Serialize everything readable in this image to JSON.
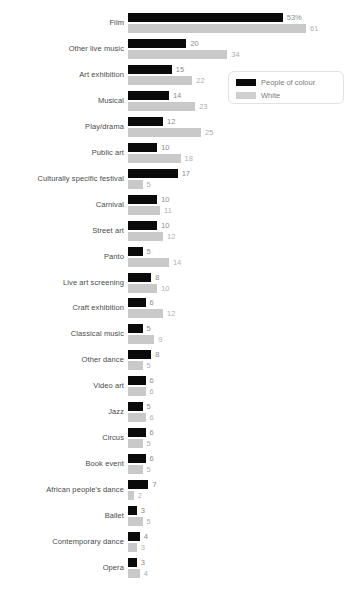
{
  "chart_data": {
    "type": "bar",
    "orientation": "horizontal",
    "title": "",
    "subtitle": "",
    "xlabel": "",
    "ylabel": "",
    "grid": false,
    "legend_position": "top-right",
    "xlim": [
      0,
      61
    ],
    "categories": [
      "Film",
      "Other live music",
      "Art exhibition",
      "Musical",
      "Play/drama",
      "Public art",
      "Culturally specific festival",
      "Carnival",
      "Street art",
      "Panto",
      "Live art screening",
      "Craft exhibition",
      "Classical music",
      "Other dance",
      "Video art",
      "Jazz",
      "Circus",
      "Book event",
      "African people's dance",
      "Ballet",
      "Contemporary dance",
      "Opera"
    ],
    "series": [
      {
        "name": "People of colour",
        "color": "#0a0a0a",
        "values": [
          53,
          20,
          15,
          14,
          12,
          10,
          17,
          10,
          10,
          5,
          8,
          6,
          5,
          8,
          6,
          5,
          6,
          6,
          7,
          3,
          4,
          3
        ],
        "labels": [
          "53%",
          "20",
          "15",
          "14",
          "12",
          "10",
          "17",
          "10",
          "10",
          "5",
          "8",
          "6",
          "5",
          "8",
          "6",
          "5",
          "6",
          "6",
          "7",
          "3",
          "4",
          "3"
        ]
      },
      {
        "name": "White",
        "color": "#c9c9c9",
        "values": [
          61,
          34,
          22,
          23,
          25,
          18,
          5,
          11,
          12,
          14,
          10,
          12,
          9,
          5,
          6,
          6,
          5,
          5,
          2,
          5,
          3,
          4
        ],
        "labels": [
          "61",
          "34",
          "22",
          "23",
          "25",
          "18",
          "5",
          "11",
          "12",
          "14",
          "10",
          "12",
          "9",
          "5",
          "6",
          "6",
          "5",
          "5",
          "2",
          "5",
          "3",
          "4"
        ]
      }
    ]
  },
  "legend": {
    "items": [
      {
        "label": "People of colour",
        "swatch": "poc"
      },
      {
        "label": "White",
        "swatch": "white"
      }
    ]
  }
}
